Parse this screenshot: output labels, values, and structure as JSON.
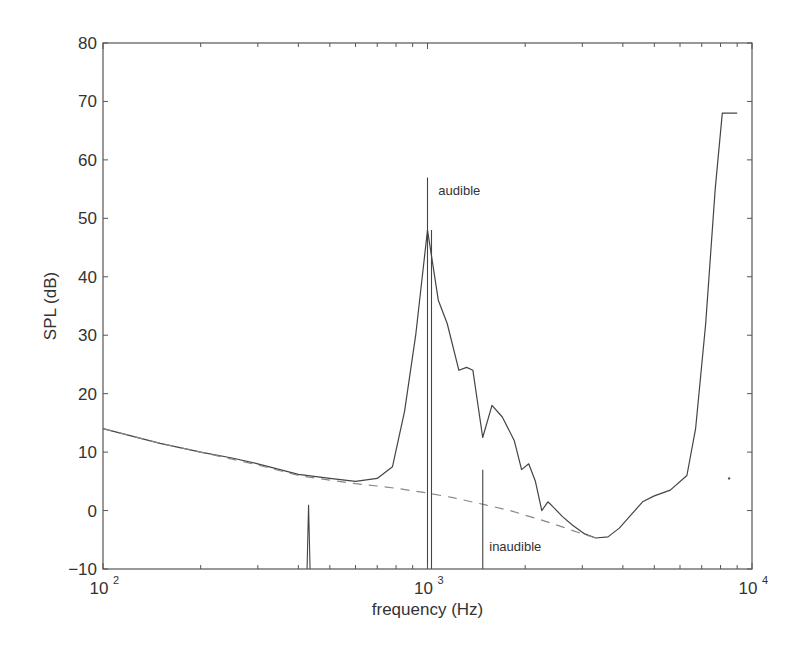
{
  "chart_data": {
    "type": "line",
    "title": "",
    "xlabel": "frequency (Hz)",
    "ylabel": "SPL (dB)",
    "xscale": "log",
    "xlim": [
      100,
      10000
    ],
    "ylim": [
      -10,
      80
    ],
    "grid": false,
    "legend": null,
    "x_ticks": [
      {
        "value": 100,
        "base": "10",
        "exp": "2"
      },
      {
        "value": 1000,
        "base": "10",
        "exp": "3"
      },
      {
        "value": 10000,
        "base": "10",
        "exp": "4"
      }
    ],
    "y_ticks": [
      {
        "value": 80,
        "label": "80"
      },
      {
        "value": 70,
        "label": "70"
      },
      {
        "value": 60,
        "label": "60"
      },
      {
        "value": 50,
        "label": "50"
      },
      {
        "value": 40,
        "label": "40"
      },
      {
        "value": 30,
        "label": "30"
      },
      {
        "value": 20,
        "label": "20"
      },
      {
        "value": 10,
        "label": "10"
      },
      {
        "value": 0,
        "label": "0"
      },
      {
        "value": -10,
        "label": "−10"
      }
    ],
    "series": [
      {
        "name": "masked threshold",
        "style": "solid",
        "x": [
          100,
          150,
          200,
          250,
          300,
          400,
          500,
          600,
          700,
          780,
          850,
          920,
          1000,
          1080,
          1150,
          1250,
          1320,
          1380,
          1480,
          1580,
          1700,
          1850,
          1950,
          2050,
          2150,
          2250,
          2350,
          2450,
          2600,
          2800,
          3050,
          3300,
          3600,
          3900,
          4200,
          4600,
          5000,
          5600,
          6300,
          6700,
          7200,
          7700,
          8100,
          9000
        ],
        "values": [
          14,
          11.5,
          10,
          9,
          8,
          6.2,
          5.5,
          5,
          5.5,
          7.5,
          17,
          30,
          48,
          36,
          32,
          24,
          24.5,
          24,
          12.5,
          18,
          16,
          12,
          7,
          8,
          5,
          0,
          1.5,
          0.5,
          -1,
          -2.5,
          -4,
          -4.7,
          -4.5,
          -3,
          -1,
          1.5,
          2.5,
          3.5,
          6,
          14,
          32,
          55,
          68,
          68
        ]
      },
      {
        "name": "threshold in quiet",
        "style": "dashed",
        "x": [
          100,
          150,
          200,
          250,
          300,
          400,
          500,
          600,
          700,
          800,
          1000,
          1200,
          1500,
          1800,
          2000,
          2300,
          2600,
          3000,
          3300
        ],
        "values": [
          14,
          11.5,
          10,
          8.8,
          7.8,
          6,
          5.2,
          4.6,
          4.2,
          3.8,
          3,
          2.2,
          1,
          0,
          -0.8,
          -1.8,
          -2.8,
          -4,
          -4.7
        ]
      }
    ],
    "tones": [
      {
        "freq": 430,
        "level": 1
      },
      {
        "freq": 1000,
        "level": 57,
        "label": "audible"
      },
      {
        "freq": 1030,
        "level": -10
      },
      {
        "freq": 1480,
        "level": 7,
        "label": "inaudible"
      }
    ],
    "annotations": [
      {
        "text": "audible",
        "x_freq": 1080,
        "y": 54
      },
      {
        "text": "inaudible",
        "x_freq": 1550,
        "y": -7
      }
    ],
    "colors": {
      "line": "#444444",
      "dashed": "#888888",
      "axis": "#555555",
      "text": "#333333"
    }
  }
}
